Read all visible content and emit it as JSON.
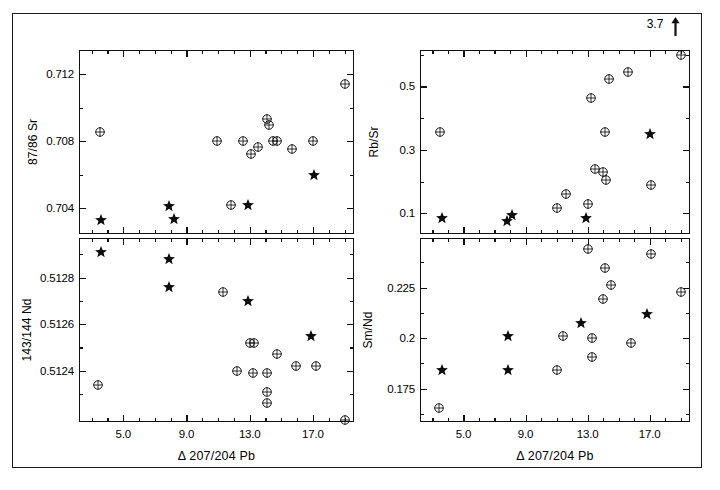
{
  "figure": {
    "title": "",
    "panel_count": 4,
    "background": "#ffffff",
    "frame_color": "#111111"
  },
  "axis_titles": {
    "x_common": "Δ 207/204 Pb",
    "y_sr": "87/86 Sr",
    "y_nd": "143/144 Nd",
    "y_rbsr": "Rb/Sr",
    "y_smnd": "Sm/Nd"
  },
  "annotations": {
    "offscale_value": "3.7"
  },
  "legend": {
    "circle_label": "open-circle-sample",
    "star_label": "filled-star-sample"
  },
  "chart_data": [
    {
      "id": "panel-sr",
      "type": "scatter",
      "title": "",
      "xlabel": "Δ 207/204 Pb",
      "ylabel": "87/86 Sr",
      "xlim": [
        2.2,
        19.6
      ],
      "ylim": [
        0.70245,
        0.71345
      ],
      "xticks": [
        5.0,
        9.0,
        13.0,
        17.0
      ],
      "xticklabels": [
        "5.0",
        "9.0",
        "13.0",
        "17.0"
      ],
      "xminorstep": 1.0,
      "yticks": [
        0.704,
        0.708,
        0.712
      ],
      "yticklabels": [
        "0.704",
        "0.708",
        "0.712"
      ],
      "yminor": [
        0.702,
        0.706,
        0.71
      ],
      "grid": false,
      "legend_position": "none",
      "series": [
        {
          "name": "open-circle",
          "marker": "circle-cross",
          "points": [
            [
              3.5,
              0.70855
            ],
            [
              10.9,
              0.708
            ],
            [
              12.6,
              0.70798
            ],
            [
              13.1,
              0.70722
            ],
            [
              13.5,
              0.70768
            ],
            [
              14.1,
              0.7093
            ],
            [
              14.2,
              0.70898
            ],
            [
              14.5,
              0.708
            ],
            [
              14.7,
              0.708
            ],
            [
              15.7,
              0.70752
            ],
            [
              17.0,
              0.708
            ],
            [
              11.8,
              0.7042
            ],
            [
              19.0,
              0.7114
            ]
          ]
        },
        {
          "name": "filled-star",
          "marker": "star",
          "points": [
            [
              3.6,
              0.7033
            ],
            [
              7.9,
              0.70415
            ],
            [
              8.2,
              0.70333
            ],
            [
              12.9,
              0.70418
            ],
            [
              17.1,
              0.706
            ]
          ]
        }
      ]
    },
    {
      "id": "panel-nd",
      "type": "scatter",
      "title": "",
      "xlabel": "Δ 207/204 Pb",
      "ylabel": "143/144 Nd",
      "xlim": [
        2.2,
        19.6
      ],
      "ylim": [
        0.51218,
        0.51297
      ],
      "xticks": [
        5.0,
        9.0,
        13.0,
        17.0
      ],
      "xticklabels": [
        "5.0",
        "9.0",
        "13.0",
        "17.0"
      ],
      "xminorstep": 1.0,
      "yticks": [
        0.5124,
        0.5126,
        0.5128
      ],
      "yticklabels": [
        "0.5124",
        "0.5126",
        "0.5128"
      ],
      "yminor": [
        0.5123,
        0.5125,
        0.5127,
        0.5129
      ],
      "grid": false,
      "legend_position": "none",
      "series": [
        {
          "name": "open-circle",
          "marker": "circle-cross",
          "points": [
            [
              3.4,
              0.51234
            ],
            [
              11.3,
              0.51274
            ],
            [
              12.2,
              0.5124
            ],
            [
              13.0,
              0.51252
            ],
            [
              13.3,
              0.51252
            ],
            [
              13.2,
              0.51239
            ],
            [
              14.1,
              0.51239
            ],
            [
              14.1,
              0.51231
            ],
            [
              14.1,
              0.51226
            ],
            [
              14.7,
              0.51247
            ],
            [
              15.9,
              0.51242
            ],
            [
              17.2,
              0.51242
            ],
            [
              19.0,
              0.51219
            ]
          ]
        },
        {
          "name": "filled-star",
          "marker": "star",
          "points": [
            [
              3.6,
              0.51291
            ],
            [
              7.9,
              0.51288
            ],
            [
              7.9,
              0.51276
            ],
            [
              12.9,
              0.5127
            ],
            [
              16.9,
              0.51255
            ]
          ]
        }
      ]
    },
    {
      "id": "panel-rbsr",
      "type": "scatter",
      "title": "",
      "xlabel": "Δ 207/204 Pb",
      "ylabel": "Rb/Sr",
      "xlim": [
        2.2,
        19.6
      ],
      "ylim": [
        0.035,
        0.615
      ],
      "xticks": [
        5.0,
        9.0,
        13.0,
        17.0
      ],
      "xticklabels": [
        "5.0",
        "9.0",
        "13.0",
        "17.0"
      ],
      "xminorstep": 1.0,
      "yticks": [
        0.1,
        0.3,
        0.5
      ],
      "yticklabels": [
        "0.1",
        "0.3",
        "0.5"
      ],
      "yminor": [
        0.2,
        0.4,
        0.6
      ],
      "grid": false,
      "legend_position": "none",
      "annotations": [
        {
          "text": "3.7",
          "x": 19.0,
          "y": 0.6,
          "arrow": "up"
        }
      ],
      "series": [
        {
          "name": "open-circle",
          "marker": "circle-cross",
          "points": [
            [
              3.5,
              0.355
            ],
            [
              11.0,
              0.118
            ],
            [
              11.6,
              0.16
            ],
            [
              13.0,
              0.13
            ],
            [
              13.2,
              0.465
            ],
            [
              13.5,
              0.24
            ],
            [
              14.0,
              0.23
            ],
            [
              14.2,
              0.205
            ],
            [
              14.1,
              0.355
            ],
            [
              14.4,
              0.525
            ],
            [
              15.6,
              0.545
            ],
            [
              17.1,
              0.19
            ],
            [
              19.0,
              0.6
            ]
          ]
        },
        {
          "name": "filled-star",
          "marker": "star",
          "points": [
            [
              3.6,
              0.085
            ],
            [
              7.8,
              0.075
            ],
            [
              8.1,
              0.095
            ],
            [
              12.9,
              0.085
            ],
            [
              17.0,
              0.35
            ]
          ]
        }
      ]
    },
    {
      "id": "panel-smnd",
      "type": "scatter",
      "title": "",
      "xlabel": "Δ 207/204 Pb",
      "ylabel": "Sm/Nd",
      "xlim": [
        2.2,
        19.6
      ],
      "ylim": [
        0.1585,
        0.2495
      ],
      "xticks": [
        5.0,
        9.0,
        13.0,
        17.0
      ],
      "xticklabels": [
        "5.0",
        "9.0",
        "13.0",
        "17.0"
      ],
      "xminorstep": 1.0,
      "yticks": [
        0.175,
        0.2,
        0.225
      ],
      "yticklabels": [
        "0.175",
        "0.2",
        "0.225"
      ],
      "yminor": [
        0.1625,
        0.1875,
        0.2125,
        0.2375
      ],
      "grid": false,
      "legend_position": "none",
      "series": [
        {
          "name": "open-circle",
          "marker": "circle-cross",
          "points": [
            [
              3.4,
              0.1655
            ],
            [
              11.0,
              0.184
            ],
            [
              11.4,
              0.201
            ],
            [
              13.0,
              0.244
            ],
            [
              13.3,
              0.2
            ],
            [
              13.3,
              0.1905
            ],
            [
              14.0,
              0.2195
            ],
            [
              14.1,
              0.2345
            ],
            [
              14.5,
              0.2265
            ],
            [
              15.8,
              0.1975
            ],
            [
              17.1,
              0.2415
            ],
            [
              19.0,
              0.223
            ]
          ]
        },
        {
          "name": "filled-star",
          "marker": "star",
          "points": [
            [
              3.6,
              0.184
            ],
            [
              7.9,
              0.201
            ],
            [
              7.9,
              0.184
            ],
            [
              12.6,
              0.2075
            ],
            [
              16.8,
              0.212
            ]
          ]
        }
      ]
    }
  ]
}
